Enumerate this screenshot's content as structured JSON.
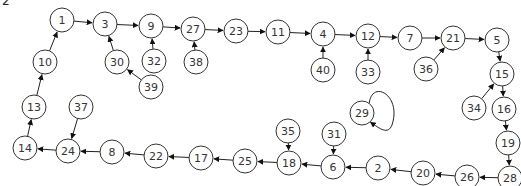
{
  "figure": {
    "corner_label": "2",
    "node_radius": 12,
    "colors": {
      "stroke": "#333333",
      "fill": "#ffffff",
      "text": "#333333"
    },
    "nodes": [
      {
        "id": "1",
        "x": 62,
        "y": 20
      },
      {
        "id": "3",
        "x": 105,
        "y": 24
      },
      {
        "id": "9",
        "x": 151,
        "y": 26
      },
      {
        "id": "27",
        "x": 193,
        "y": 29
      },
      {
        "id": "23",
        "x": 236,
        "y": 31
      },
      {
        "id": "11",
        "x": 278,
        "y": 32
      },
      {
        "id": "4",
        "x": 323,
        "y": 34
      },
      {
        "id": "12",
        "x": 368,
        "y": 36
      },
      {
        "id": "7",
        "x": 410,
        "y": 38
      },
      {
        "id": "21",
        "x": 453,
        "y": 38
      },
      {
        "id": "5",
        "x": 497,
        "y": 40
      },
      {
        "id": "10",
        "x": 45,
        "y": 62
      },
      {
        "id": "30",
        "x": 117,
        "y": 62
      },
      {
        "id": "32",
        "x": 154,
        "y": 61
      },
      {
        "id": "38",
        "x": 196,
        "y": 62
      },
      {
        "id": "40",
        "x": 323,
        "y": 70
      },
      {
        "id": "33",
        "x": 368,
        "y": 72
      },
      {
        "id": "36",
        "x": 426,
        "y": 69
      },
      {
        "id": "15",
        "x": 502,
        "y": 74
      },
      {
        "id": "39",
        "x": 151,
        "y": 87
      },
      {
        "id": "13",
        "x": 34,
        "y": 107
      },
      {
        "id": "37",
        "x": 81,
        "y": 107
      },
      {
        "id": "34",
        "x": 474,
        "y": 108
      },
      {
        "id": "16",
        "x": 504,
        "y": 109
      },
      {
        "id": "29",
        "x": 362,
        "y": 113
      },
      {
        "id": "19",
        "x": 508,
        "y": 143
      },
      {
        "id": "35",
        "x": 288,
        "y": 131
      },
      {
        "id": "31",
        "x": 334,
        "y": 134
      },
      {
        "id": "14",
        "x": 25,
        "y": 148
      },
      {
        "id": "24",
        "x": 68,
        "y": 151
      },
      {
        "id": "8",
        "x": 112,
        "y": 152
      },
      {
        "id": "22",
        "x": 156,
        "y": 156
      },
      {
        "id": "17",
        "x": 201,
        "y": 158
      },
      {
        "id": "25",
        "x": 245,
        "y": 161
      },
      {
        "id": "18",
        "x": 289,
        "y": 163
      },
      {
        "id": "6",
        "x": 333,
        "y": 167
      },
      {
        "id": "2",
        "x": 378,
        "y": 168
      },
      {
        "id": "20",
        "x": 423,
        "y": 173
      },
      {
        "id": "26",
        "x": 467,
        "y": 177
      },
      {
        "id": "28",
        "x": 510,
        "y": 178
      }
    ],
    "edges": [
      [
        "1",
        "3"
      ],
      [
        "3",
        "9"
      ],
      [
        "9",
        "27"
      ],
      [
        "27",
        "23"
      ],
      [
        "23",
        "11"
      ],
      [
        "11",
        "4"
      ],
      [
        "4",
        "12"
      ],
      [
        "12",
        "7"
      ],
      [
        "7",
        "21"
      ],
      [
        "21",
        "5"
      ],
      [
        "5",
        "15"
      ],
      [
        "15",
        "16"
      ],
      [
        "16",
        "19"
      ],
      [
        "19",
        "28"
      ],
      [
        "28",
        "26"
      ],
      [
        "26",
        "20"
      ],
      [
        "20",
        "2"
      ],
      [
        "2",
        "6"
      ],
      [
        "6",
        "18"
      ],
      [
        "18",
        "25"
      ],
      [
        "25",
        "17"
      ],
      [
        "17",
        "22"
      ],
      [
        "22",
        "8"
      ],
      [
        "8",
        "24"
      ],
      [
        "24",
        "14"
      ],
      [
        "14",
        "13"
      ],
      [
        "13",
        "10"
      ],
      [
        "10",
        "1"
      ],
      [
        "30",
        "3"
      ],
      [
        "39",
        "30"
      ],
      [
        "32",
        "9"
      ],
      [
        "38",
        "27"
      ],
      [
        "40",
        "4"
      ],
      [
        "33",
        "12"
      ],
      [
        "36",
        "21"
      ],
      [
        "34",
        "15"
      ],
      [
        "35",
        "18"
      ],
      [
        "31",
        "6"
      ],
      [
        "37",
        "24"
      ],
      [
        "29",
        "29"
      ]
    ]
  }
}
